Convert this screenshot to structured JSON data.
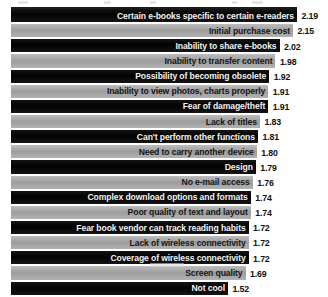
{
  "chart_data": {
    "type": "bar",
    "title": "",
    "subtitle": "",
    "xlabel": "",
    "ylabel": "",
    "orientation": "horizontal",
    "grid": false,
    "legend": null,
    "value_axis_note": "bar length proportional to mean rating",
    "xlim": [
      0,
      2.19
    ],
    "categories": [
      "Certain e-books specific to certain e-readers",
      "Initial purchase cost",
      "Inability to share e-books",
      "Inability to transfer content",
      "Possibility of becoming obsolete",
      "Inability to view photos, charts properly",
      "Fear of damage/theft",
      "Lack of titles",
      "Can't perform other functions",
      "Need to carry another device",
      "Design",
      "No e-mail access",
      "Complex download options and formats",
      "Poor quality of text and layout",
      "Fear book vendor can track reading habits",
      "Lack of wireless connectivity",
      "Coverage of wireless connectivity",
      "Screen quality",
      "Not cool"
    ],
    "values": [
      2.19,
      2.15,
      2.02,
      1.98,
      1.92,
      1.91,
      1.91,
      1.83,
      1.81,
      1.8,
      1.79,
      1.76,
      1.74,
      1.74,
      1.72,
      1.72,
      1.72,
      1.69,
      1.52
    ],
    "value_labels": [
      "2.19",
      "2.15",
      "2.02",
      "1.98",
      "1.92",
      "1.91",
      "1.91",
      "1.83",
      "1.81",
      "1.80",
      "1.79",
      "1.76",
      "1.74",
      "1.74",
      "1.72",
      "1.72",
      "1.72",
      "1.69",
      "1.52"
    ],
    "bar_colors": [
      "#0d0d0d",
      "#a8a8a8"
    ],
    "colors": {
      "dark_bar": "#0d0d0d",
      "light_bar": "#a8a8a8",
      "dark_bar_text": "#f2f2f2",
      "light_bar_text": "#161616",
      "value_text": "#111111",
      "background": "#ffffff"
    }
  },
  "rows": [
    {
      "label": "Certain e-books specific to certain e-readers",
      "value": "2.19"
    },
    {
      "label": "Initial purchase cost",
      "value": "2.15"
    },
    {
      "label": "Inability to share e-books",
      "value": "2.02"
    },
    {
      "label": "Inability to transfer content",
      "value": "1.98"
    },
    {
      "label": "Possibility of becoming obsolete",
      "value": "1.92"
    },
    {
      "label": "Inability to view photos, charts properly",
      "value": "1.91"
    },
    {
      "label": "Fear of damage/theft",
      "value": "1.91"
    },
    {
      "label": "Lack of titles",
      "value": "1.83"
    },
    {
      "label": "Can't perform other functions",
      "value": "1.81"
    },
    {
      "label": "Need to carry another device",
      "value": "1.80"
    },
    {
      "label": "Design",
      "value": "1.79"
    },
    {
      "label": "No e-mail access",
      "value": "1.76"
    },
    {
      "label": "Complex download options and formats",
      "value": "1.74"
    },
    {
      "label": "Poor quality of text and layout",
      "value": "1.74"
    },
    {
      "label": "Fear book vendor can track reading habits",
      "value": "1.72"
    },
    {
      "label": "Lack of wireless connectivity",
      "value": "1.72"
    },
    {
      "label": "Coverage of wireless connectivity",
      "value": "1.72"
    },
    {
      "label": "Screen quality",
      "value": "1.69"
    },
    {
      "label": "Not cool",
      "value": "1.52"
    }
  ]
}
